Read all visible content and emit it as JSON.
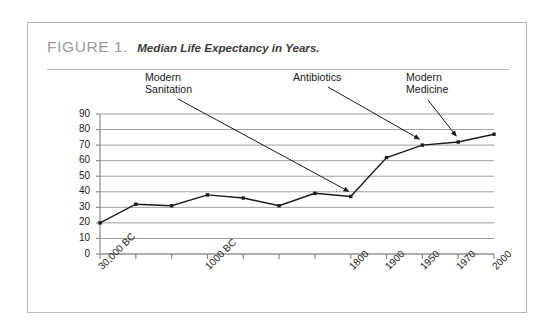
{
  "figure": {
    "number": "FIGURE 1.",
    "caption": "Median Life Expectancy in Years."
  },
  "annotations": [
    {
      "id": "modern-sanitation",
      "text": "Modern\nSanitation"
    },
    {
      "id": "antibiotics",
      "text": "Antibiotics"
    },
    {
      "id": "modern-medicine",
      "text": "Modern\nMedicine"
    }
  ],
  "colors": {
    "border": "#b9b9b9",
    "figure_number": "#9a9a9a",
    "caption": "#3a3a3a",
    "gridline": "#9e9e9e",
    "axis": "#8a8a8a",
    "series": "#1a1a1a",
    "background": "#ffffff"
  },
  "chart_data": {
    "type": "line",
    "title": "Median Life Expectancy in Years.",
    "xlabel": "",
    "ylabel": "",
    "ylim": [
      0,
      90
    ],
    "ytick_step": 10,
    "yticks": [
      0,
      10,
      20,
      30,
      40,
      50,
      60,
      70,
      80,
      90
    ],
    "grid": true,
    "legend": false,
    "categories": [
      "30,000 BC",
      "",
      "",
      "1000 BC",
      "",
      "",
      "",
      "1800",
      "1900",
      "1950",
      "1970",
      "2000"
    ],
    "tick_labels": [
      "30,000 BC",
      "1000 BC",
      "1800",
      "1900",
      "1950",
      "1970",
      "2000"
    ],
    "series": [
      {
        "name": "Median Life Expectancy",
        "values": [
          20,
          32,
          31,
          38,
          36,
          31,
          39,
          37,
          62,
          70,
          72,
          77
        ]
      }
    ],
    "annotations": [
      {
        "label": "Modern Sanitation",
        "points_to_index": 7,
        "points_to_value": 37
      },
      {
        "label": "Antibiotics",
        "points_to_index": 9,
        "points_to_value": 70
      },
      {
        "label": "Modern Medicine",
        "points_to_index": 10,
        "points_to_value": 72
      }
    ]
  }
}
